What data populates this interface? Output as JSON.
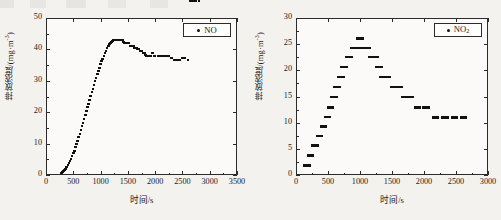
{
  "figure_background": "#f3f2ef",
  "axis_color": "#2b2b2b",
  "marker_color": "#111111",
  "charts": [
    {
      "id": "no-chart",
      "legend_label": "NO",
      "legend_sub": "",
      "xlabel": "时间/s",
      "ylabel": "排放浓度/(mg·m",
      "ylabel_exp": "-3",
      "ylabel_tail": ")",
      "xticks": [
        "0",
        "500",
        "1000",
        "1500",
        "2000",
        "2500",
        "3000",
        "3500"
      ],
      "yticks": [
        "0",
        "10",
        "20",
        "30",
        "40",
        "50"
      ],
      "chart_data": {
        "type": "scatter",
        "title": "",
        "xlabel": "时间/s",
        "ylabel": "排放浓度/(mg·m⁻³)",
        "series_name": "NO",
        "xlim": [
          0,
          3500
        ],
        "ylim": [
          0,
          50
        ],
        "xticks": [
          0,
          500,
          1000,
          1500,
          2000,
          2500,
          3000,
          3500
        ],
        "yticks": [
          0,
          10,
          20,
          30,
          40,
          50
        ],
        "grid": false,
        "legend_position": "top-right",
        "x": [
          280,
          300,
          320,
          340,
          360,
          380,
          400,
          420,
          440,
          460,
          480,
          500,
          520,
          540,
          560,
          580,
          600,
          620,
          640,
          660,
          680,
          700,
          720,
          740,
          760,
          780,
          800,
          820,
          840,
          860,
          880,
          900,
          920,
          940,
          960,
          980,
          1000,
          1020,
          1040,
          1060,
          1080,
          1100,
          1120,
          1140,
          1160,
          1180,
          1200,
          1220,
          1240,
          1260,
          1280,
          1300,
          1320,
          1340,
          1360,
          1380,
          1400,
          1420,
          1440,
          1460,
          1480,
          1500,
          1520,
          1540,
          1560,
          1580,
          1600,
          1620,
          1640,
          1660,
          1680,
          1700,
          1720,
          1740,
          1760,
          1780,
          1800,
          1820,
          1840,
          1860,
          1880,
          1900,
          1920,
          1940,
          1960,
          1980,
          2000,
          2050,
          2100,
          2150,
          2200,
          2250,
          2300,
          2350,
          2400,
          2450,
          2500,
          2550,
          2600,
          2650,
          2700,
          2750,
          2800
        ],
        "y": [
          0.6,
          0.9,
          1.2,
          1.6,
          2.0,
          2.5,
          3.1,
          3.7,
          4.4,
          5.2,
          6.0,
          6.9,
          7.8,
          8.8,
          9.8,
          10.9,
          12.0,
          13.1,
          14.3,
          15.5,
          16.7,
          17.9,
          19.1,
          20.3,
          21.5,
          22.7,
          23.9,
          25.1,
          26.3,
          27.5,
          28.7,
          29.9,
          31.0,
          32.1,
          33.2,
          34.2,
          35.2,
          36.2,
          37.1,
          38.0,
          38.8,
          39.6,
          40.3,
          41.0,
          41.6,
          42.1,
          42.5,
          42.8,
          43.0,
          43.0,
          43.0,
          43.0,
          43.0,
          43.0,
          43.0,
          43.0,
          43.0,
          42.4,
          41.9,
          41.9,
          41.9,
          41.9,
          41.9,
          41.2,
          41.2,
          41.2,
          41.2,
          40.6,
          40.6,
          40.6,
          40.0,
          40.0,
          39.4,
          39.4,
          39.4,
          38.9,
          38.9,
          38.3,
          37.8,
          37.8,
          37.8,
          37.8,
          37.8,
          38.9,
          38.9,
          37.8,
          37.8,
          37.8,
          37.8,
          37.8,
          37.8,
          37.8,
          37.2,
          36.7,
          36.7,
          36.7,
          37.2,
          37.2,
          36.7
        ]
      }
    },
    {
      "id": "no2-chart",
      "legend_label": "NO",
      "legend_sub": "2",
      "xlabel": "时间/s",
      "ylabel": "排放浓度/(mg·m",
      "ylabel_exp": "-3",
      "ylabel_tail": ")",
      "xticks": [
        "0",
        "500",
        "1000",
        "1500",
        "2000",
        "2500",
        "3000"
      ],
      "yticks": [
        "0",
        "5",
        "10",
        "15",
        "20",
        "25",
        "30"
      ],
      "chart_data": {
        "type": "scatter",
        "title": "",
        "xlabel": "时间/s",
        "ylabel": "排放浓度/(mg·m⁻³)",
        "series_name": "NO2",
        "xlim": [
          0,
          3000
        ],
        "ylim": [
          0,
          30
        ],
        "xticks": [
          0,
          500,
          1000,
          1500,
          2000,
          2500,
          3000
        ],
        "yticks": [
          0,
          5,
          10,
          15,
          20,
          25,
          30
        ],
        "grid": false,
        "legend_position": "top-right",
        "x": [
          170,
          230,
          300,
          370,
          430,
          490,
          540,
          590,
          640,
          700,
          750,
          830,
          900,
          960,
          1000,
          1060,
          1120,
          1180,
          1240,
          1300,
          1360,
          1430,
          1520,
          1620,
          1700,
          1790,
          1900,
          2030,
          2180,
          2330,
          2480,
          2620
        ],
        "y": [
          1.8,
          3.7,
          5.6,
          7.4,
          9.3,
          11.1,
          12.9,
          14.9,
          16.8,
          18.7,
          20.6,
          22.5,
          24.3,
          24.3,
          26.1,
          24.3,
          24.3,
          22.5,
          22.5,
          20.6,
          18.7,
          18.7,
          16.8,
          16.8,
          14.9,
          14.9,
          12.9,
          12.9,
          11.0,
          11.0,
          11.0,
          11.0
        ]
      }
    }
  ]
}
